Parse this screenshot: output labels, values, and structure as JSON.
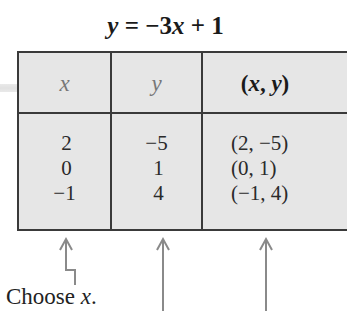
{
  "title": {
    "lhs": "y",
    "eq": " = −3",
    "var": "x",
    "rest": " + 1"
  },
  "table": {
    "headers": [
      "x",
      "y",
      "(x, y)"
    ],
    "rows": [
      {
        "x": "2",
        "y": "−5",
        "pair": "(2, −5)"
      },
      {
        "x": "0",
        "y": "1",
        "pair": "(0, 1)"
      },
      {
        "x": "−1",
        "y": "4",
        "pair": "(−1, 4)"
      }
    ]
  },
  "annotation": {
    "caption_prefix": "Choose ",
    "caption_var": "x",
    "caption_suffix": "."
  },
  "colors": {
    "table_fill": "#e6e6e6",
    "border": "#3a3a3a",
    "arrow": "#8a8a8a"
  }
}
